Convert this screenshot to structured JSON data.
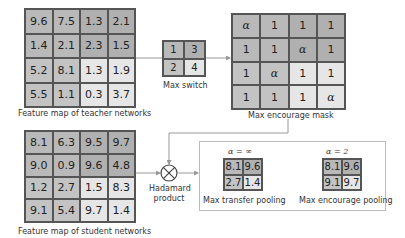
{
  "teacher": {
    "label": "Feature map of teacher networks",
    "values": [
      "9.6",
      "7.5",
      "1.3",
      "2.1",
      "1.4",
      "2.1",
      "2.3",
      "1.5",
      "5.2",
      "8.1",
      "1.3",
      "1.9",
      "5.5",
      "1.1",
      "0.3",
      "3.7"
    ],
    "colors": [
      "#b9b9b9",
      "#b9b9b9",
      "#b0b0b0",
      "#b0b0b0",
      "#b9b9b9",
      "#b9b9b9",
      "#b0b0b0",
      "#b0b0b0",
      "#c3c3c3",
      "#c3c3c3",
      "#e6e6e6",
      "#e6e6e6",
      "#c3c3c3",
      "#c3c3c3",
      "#e6e6e6",
      "#e6e6e6"
    ]
  },
  "max_switch": {
    "label": "Max switch",
    "values": [
      "1",
      "3",
      "2",
      "4"
    ],
    "colors": [
      "#b9b9b9",
      "#b0b0b0",
      "#c3c3c3",
      "#e6e6e6"
    ]
  },
  "mask": {
    "label": "Max encourage mask",
    "values": [
      "α",
      "1",
      "1",
      "1",
      "1",
      "1",
      "α",
      "1",
      "1",
      "α",
      "1",
      "1",
      "1",
      "1",
      "1",
      "α"
    ],
    "alpha_flags": [
      true,
      false,
      false,
      false,
      false,
      false,
      true,
      false,
      false,
      true,
      false,
      false,
      false,
      false,
      false,
      true
    ],
    "colors": [
      "#b9b9b9",
      "#b9b9b9",
      "#b0b0b0",
      "#b0b0b0",
      "#b9b9b9",
      "#b9b9b9",
      "#b0b0b0",
      "#b0b0b0",
      "#c3c3c3",
      "#c3c3c3",
      "#e6e6e6",
      "#e6e6e6",
      "#c3c3c3",
      "#c3c3c3",
      "#e6e6e6",
      "#e6e6e6"
    ]
  },
  "student": {
    "label": "Feature map of student networks",
    "values": [
      "8.1",
      "6.3",
      "9.5",
      "9.7",
      "9.0",
      "0.9",
      "9.6",
      "4.8",
      "1.2",
      "2.7",
      "1.5",
      "8.3",
      "9.1",
      "5.4",
      "9.7",
      "1.4"
    ],
    "colors": [
      "#b9b9b9",
      "#b9b9b9",
      "#b0b0b0",
      "#b0b0b0",
      "#b9b9b9",
      "#b9b9b9",
      "#b0b0b0",
      "#b0b0b0",
      "#c3c3c3",
      "#c3c3c3",
      "#e6e6e6",
      "#e6e6e6",
      "#c3c3c3",
      "#c3c3c3",
      "#e6e6e6",
      "#e6e6e6"
    ]
  },
  "hadamard": {
    "line1": "Hadamard",
    "line2": "product"
  },
  "transfer_pooling": {
    "title": "α = ∞",
    "label": "Max transfer pooling",
    "values": [
      "8.1",
      "9.6",
      "2.7",
      "1.4"
    ],
    "colors": [
      "#b9b9b9",
      "#b0b0b0",
      "#c3c3c3",
      "#e6e6e6"
    ]
  },
  "encourage_pooling": {
    "title": "α = 2",
    "label": "Max encourage pooling",
    "values": [
      "8.1",
      "9.6",
      "9.1",
      "9.7"
    ],
    "colors": [
      "#b9b9b9",
      "#b0b0b0",
      "#c3c3c3",
      "#e6e6e6"
    ]
  }
}
